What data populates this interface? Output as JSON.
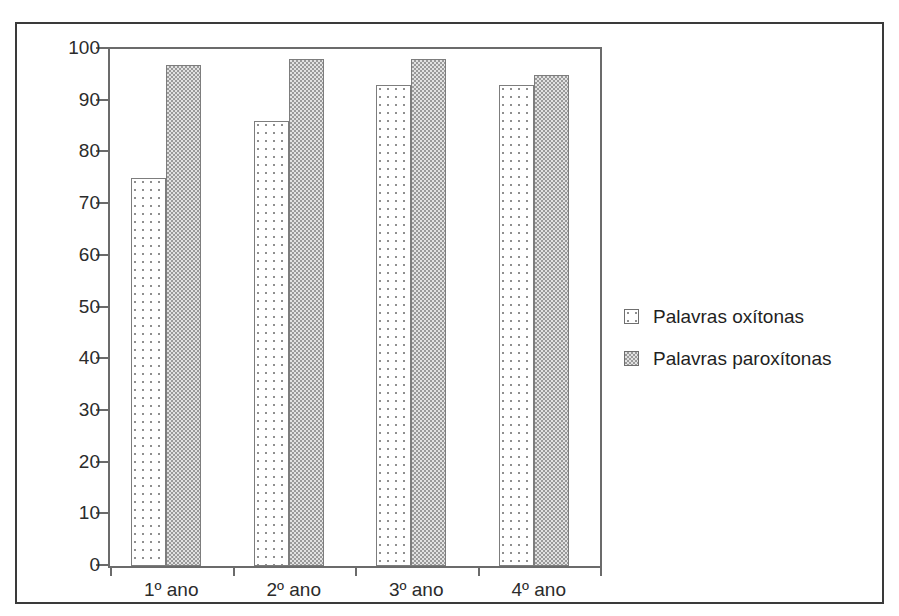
{
  "chart_data": {
    "type": "bar",
    "title": "",
    "subtitle": "",
    "xlabel": "",
    "ylabel": "",
    "categories": [
      "1º ano",
      "2º ano",
      "3º ano",
      "4º ano"
    ],
    "series": [
      {
        "name": "Palavras oxítonas",
        "values": [
          75,
          86,
          93,
          93
        ],
        "pattern": "sparse-dots"
      },
      {
        "name": "Palavras paroxítonas",
        "values": [
          97,
          98,
          98,
          95
        ],
        "pattern": "dense-checker"
      }
    ],
    "ylim": [
      0,
      100
    ],
    "ytick_step": 10,
    "yticks": [
      0,
      10,
      20,
      30,
      40,
      50,
      60,
      70,
      80,
      90,
      100
    ],
    "ytick_labels": [
      "0",
      "10",
      "20",
      "30",
      "40",
      "50",
      "60",
      "70",
      "80",
      "90",
      "100"
    ],
    "grid": false,
    "legend_position": "right",
    "axis_color": "#6b6b6b",
    "frame_color": "#3a3a3a",
    "text_color": "#2b2b2b"
  },
  "legend": {
    "entries": [
      {
        "label": "Palavras oxítonas"
      },
      {
        "label": "Palavras paroxítonas"
      }
    ]
  }
}
